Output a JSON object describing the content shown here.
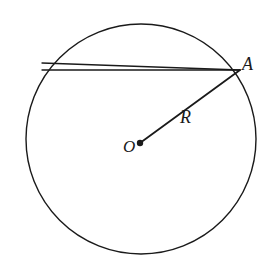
{
  "figure": {
    "background_color": "#ffffff",
    "stroke_color": "#1a1a1a",
    "labels": {
      "center_point": "O",
      "circle_point": "A",
      "radius": "R"
    },
    "icons": {
      "center_dot": "filled-dot-icon"
    }
  },
  "chart_data": {
    "type": "diagram",
    "xlabel": "",
    "ylabel": "",
    "xlim": [
      0,
      271
    ],
    "ylim": [
      0,
      267
    ],
    "grid": false,
    "legend": "none",
    "elements": [
      {
        "name": "circle-outline",
        "shape": "circle",
        "center": [
          141,
          139
        ],
        "radius": 115,
        "stroke": "#1a1a1a",
        "stroke_width": 1.4,
        "fill": "none"
      },
      {
        "name": "chord-upper",
        "shape": "line",
        "from": [
          42,
          63
        ],
        "to": [
          240,
          70
        ],
        "stroke": "#1a1a1a",
        "stroke_width": 1.3
      },
      {
        "name": "chord-lower",
        "shape": "line",
        "from": [
          42,
          70
        ],
        "to": [
          240,
          70
        ],
        "stroke": "#1a1a1a",
        "stroke_width": 1.3
      },
      {
        "name": "radius-segment",
        "shape": "line",
        "from": [
          140,
          143
        ],
        "to": [
          240,
          70
        ],
        "stroke": "#1a1a1a",
        "stroke_width": 1.8
      },
      {
        "name": "center-dot",
        "shape": "point",
        "position": [
          140,
          143
        ],
        "radius": 3.2,
        "fill": "#1a1a1a"
      }
    ],
    "annotations": [
      {
        "text": "A",
        "position": [
          248,
          66
        ],
        "style": "italic-serif"
      },
      {
        "text": "R",
        "position": [
          188,
          118
        ],
        "style": "italic-serif"
      },
      {
        "text": "O",
        "position": [
          130,
          150
        ],
        "style": "italic-serif"
      }
    ]
  }
}
